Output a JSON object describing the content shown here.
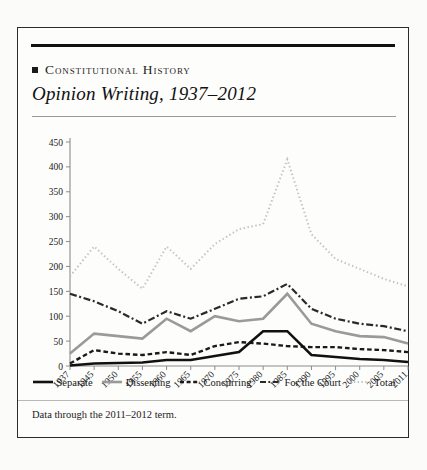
{
  "card": {
    "kicker": "Constitutional History",
    "title": "Opinion Writing, 1937–2012",
    "footnote": "Data through the 2011–2012 term."
  },
  "colors": {
    "separate": "#111111",
    "dissenting": "#9a9a9a",
    "concurring": "#1a1a1a",
    "for_the_court": "#2a2a2a",
    "total": "#c2c2c2",
    "axis": "#8c8c8c",
    "rule": "#111111"
  },
  "legend": [
    {
      "label": "Separate",
      "style": "solid",
      "color": "#111111",
      "width": 2.6
    },
    {
      "label": "Dissenting",
      "style": "solid",
      "color": "#9a9a9a",
      "width": 2.6
    },
    {
      "label": "Concurring",
      "style": "dashed",
      "color": "#1a1a1a",
      "width": 2.4
    },
    {
      "label": "For the Court",
      "style": "dashdot",
      "color": "#2a2a2a",
      "width": 2.2
    },
    {
      "label": "Total",
      "style": "dotted",
      "color": "#c2c2c2",
      "width": 2.0
    }
  ],
  "chart_data": {
    "type": "line",
    "title": "Opinion Writing, 1937–2012",
    "xlabel": "",
    "ylabel": "",
    "grid": false,
    "legend_position": "bottom",
    "categories": [
      "1937",
      "1945",
      "1950",
      "1955",
      "1960",
      "1965",
      "1970",
      "1975",
      "1980",
      "1985",
      "1990",
      "1995",
      "2000",
      "2005",
      "2011"
    ],
    "xtick_labels": [
      "1937",
      "1945",
      "1950",
      "1955",
      "1960",
      "1965",
      "1970",
      "1975",
      "1980",
      "1985",
      "1990",
      "1995",
      "2000",
      "2005",
      "2011"
    ],
    "ytick_labels": [
      "0",
      "50",
      "100",
      "150",
      "200",
      "250",
      "300",
      "350",
      "400",
      "450"
    ],
    "ylim": [
      0,
      450
    ],
    "ystep": 50,
    "series": [
      {
        "name": "Total",
        "values": [
          180,
          240,
          195,
          155,
          240,
          195,
          245,
          275,
          285,
          415,
          265,
          215,
          195,
          175,
          160
        ]
      },
      {
        "name": "For the Court",
        "values": [
          145,
          130,
          110,
          85,
          110,
          95,
          115,
          135,
          140,
          165,
          115,
          95,
          85,
          80,
          70
        ]
      },
      {
        "name": "Dissenting",
        "values": [
          25,
          65,
          60,
          55,
          95,
          70,
          100,
          90,
          95,
          145,
          85,
          70,
          60,
          58,
          45
        ]
      },
      {
        "name": "Concurring",
        "values": [
          5,
          32,
          25,
          22,
          28,
          22,
          40,
          48,
          45,
          40,
          38,
          38,
          34,
          32,
          28
        ]
      },
      {
        "name": "Separate",
        "values": [
          1,
          5,
          6,
          7,
          12,
          12,
          20,
          28,
          70,
          70,
          22,
          18,
          14,
          12,
          8
        ]
      }
    ]
  }
}
